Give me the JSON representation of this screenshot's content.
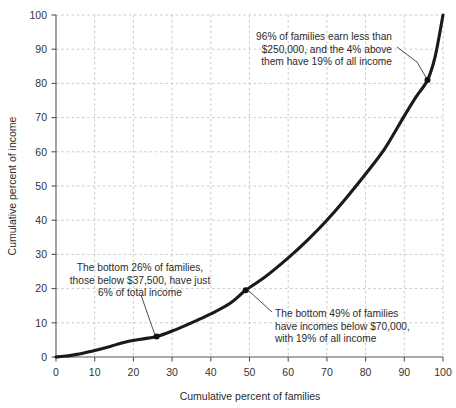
{
  "chart_data": {
    "type": "line",
    "title": "",
    "subtitle": "",
    "xlabel": "Cumulative percent of families",
    "ylabel": "Cumulative percent of income",
    "xlim": [
      0,
      100
    ],
    "ylim": [
      0,
      100
    ],
    "grid": true,
    "legend_position": "none",
    "x_ticks": [
      0,
      10,
      20,
      30,
      40,
      50,
      60,
      70,
      80,
      90,
      100
    ],
    "y_ticks": [
      0,
      10,
      20,
      30,
      40,
      50,
      60,
      70,
      80,
      90,
      100
    ],
    "x_tick_labels": [
      "0",
      "10",
      "20",
      "30",
      "40",
      "50",
      "60",
      "70",
      "80",
      "90",
      "100"
    ],
    "y_tick_labels": [
      "0",
      "10",
      "20",
      "30",
      "40",
      "50",
      "60",
      "70",
      "80",
      "90",
      "100"
    ],
    "series": [
      {
        "name": "Lorenz curve",
        "color": "#1a1a1a",
        "x": [
          0,
          2,
          5,
          8,
          10,
          14,
          18,
          22,
          26,
          30,
          35,
          40,
          45,
          49,
          54,
          60,
          65,
          70,
          75,
          80,
          85,
          90,
          93,
          96,
          98,
          100
        ],
        "values": [
          0,
          0.2,
          0.7,
          1.4,
          1.9,
          3.1,
          4.4,
          5.2,
          6.0,
          7.6,
          10.0,
          12.6,
          15.7,
          19.5,
          23.4,
          29.0,
          34.2,
          40.0,
          46.5,
          53.5,
          61.0,
          70.5,
          76.0,
          81.0,
          88.0,
          100.0
        ]
      }
    ],
    "markers": [
      {
        "x": 26,
        "y": 6.0,
        "label": "bottom-26-marker"
      },
      {
        "x": 49,
        "y": 19.5,
        "label": "bottom-49-marker"
      },
      {
        "x": 96,
        "y": 81.0,
        "label": "top-4-marker"
      }
    ],
    "annotations": [
      {
        "id": "annotation-top-right",
        "lines": [
          "96% of families earn less than",
          "$250,000, and the 4% above",
          "them have 19% of all income"
        ],
        "target_x": 96,
        "target_y": 81.0
      },
      {
        "id": "annotation-left",
        "lines": [
          "The bottom 26% of families,",
          "those below $37,500, have just",
          "6% of total income"
        ],
        "target_x": 26,
        "target_y": 6.0
      },
      {
        "id": "annotation-right",
        "lines": [
          "The bottom 49% of families",
          "have incomes below $70,000,",
          "with 19% of all income"
        ],
        "target_x": 49,
        "target_y": 19.5
      }
    ],
    "colors": {
      "curve": "#1a1a1a",
      "grid": "#bdbdbd",
      "axis": "#555555",
      "text": "#2b2b2b",
      "background": "#ffffff"
    }
  }
}
